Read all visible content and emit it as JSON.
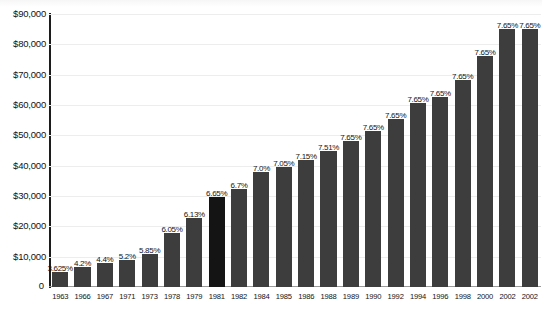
{
  "chart_data": {
    "type": "bar",
    "title": "",
    "subtitle": "",
    "xlabel": "",
    "ylabel": "",
    "grid": true,
    "legend": null,
    "ylim": [
      0,
      90000
    ],
    "yticks": [
      0,
      10000,
      20000,
      30000,
      40000,
      50000,
      60000,
      70000,
      80000,
      90000
    ],
    "ytick_labels": [
      "0",
      "$10,000",
      "$20,000",
      "$30,000",
      "$40,000",
      "$50,000",
      "$60,000",
      "$70,000",
      "$80,000",
      "$90,000"
    ],
    "categories": [
      "1963",
      "1966",
      "1967",
      "1971",
      "1973",
      "1978",
      "1979",
      "1981",
      "1982",
      "1984",
      "1985",
      "1986",
      "1988",
      "1989",
      "1990",
      "1992",
      "1994",
      "1996",
      "1998",
      "2000",
      "2002",
      "2002"
    ],
    "values": [
      4800,
      6600,
      7800,
      9000,
      10800,
      17700,
      22900,
      29700,
      32400,
      37800,
      39600,
      42000,
      45000,
      48000,
      51300,
      55500,
      60600,
      62700,
      68400,
      76200,
      84900,
      84900
    ],
    "data_labels": [
      "3.625%",
      "4.2%",
      "4.4%",
      "5.2%",
      "5.85%",
      "6.05%",
      "6.13%",
      "6.65%",
      "6.7%",
      "7.0%",
      "7.05%",
      "7.15%",
      "7.51%",
      "7.65%",
      "7.65%",
      "7.65%",
      "7.65%",
      "7.65%",
      "7.65%",
      "7.65%",
      "7.65%",
      "7.65%"
    ],
    "highlight_index": 7,
    "bar_color": "#3d3d3d",
    "highlight_color": "#141414",
    "grid_color": "#ededed",
    "axis_color": "#1c1c1c",
    "background": "#ffffff"
  },
  "axis": {
    "y_label_0": "0"
  }
}
